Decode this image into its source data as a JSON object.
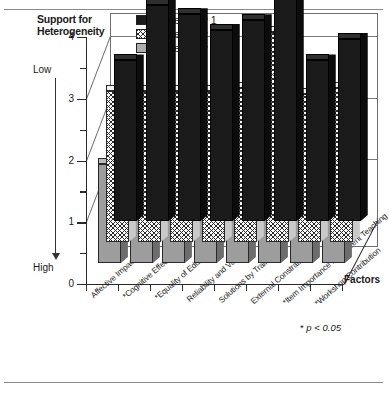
{
  "axes": {
    "y_title": "Support for Heterogeneity",
    "y_low_label": "Low",
    "y_high_label": "High",
    "y_ticks": [
      "0",
      "1",
      "2",
      "3",
      "4"
    ],
    "depth_axis_label": "Factors"
  },
  "legend": {
    "items": [
      {
        "label": "Seniority 1",
        "swatch": "black"
      },
      {
        "label": "Seniority 2  &  3",
        "swatch": "checkered"
      },
      {
        "label": "Seniority 4+",
        "swatch": "gray"
      }
    ]
  },
  "footnote": {
    "star": "*",
    "text": "p < 0.05"
  },
  "chart_data": {
    "type": "bar",
    "title": "Support for Heterogeneity",
    "xlabel": "Factors",
    "ylabel": "Support for Heterogeneity",
    "ylim": [
      0,
      4
    ],
    "yticks": [
      0,
      1,
      2,
      3,
      4
    ],
    "y_minor_tick_step": 0.5,
    "grid": true,
    "legend_position": "top-left-inside",
    "orientation": "vertical-3d",
    "categories": [
      "Affective Impact of Heterogeneity",
      "*Cognitive Effects of Heterogeneity",
      "*Equality of Educational Opportunity",
      "Reliability and Validity",
      "Solutions by Training",
      "External Constraints",
      "*Item Importance in Different Teaching",
      "*Workshop Contribution"
    ],
    "series": [
      {
        "name": "Seniority 1",
        "values": [
          2.6,
          3.5,
          3.35,
          3.1,
          3.25,
          4.0,
          2.6,
          2.95
        ]
      },
      {
        "name": "Seniority 2  &  3",
        "values": [
          2.45,
          2.45,
          2.45,
          2.45,
          2.5,
          3.4,
          2.4,
          2.5
        ]
      },
      {
        "name": "Seniority 4+",
        "values": [
          1.6,
          2.2,
          2.25,
          2.25,
          2.45,
          3.2,
          1.25,
          1.75
        ]
      }
    ],
    "annotations": [
      "Low = high on scale top",
      "High = low on scale bottom",
      "* p < 0.05"
    ]
  }
}
